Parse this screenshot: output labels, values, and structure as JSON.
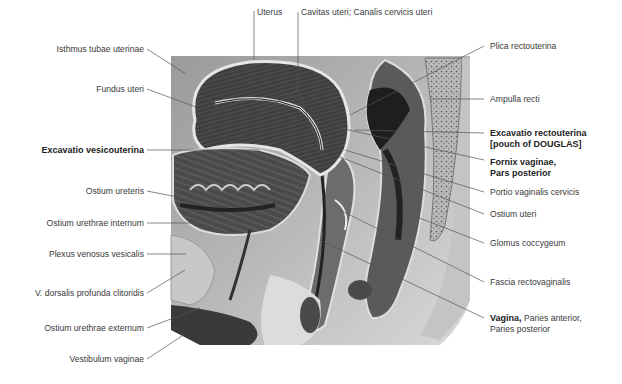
{
  "figure": {
    "colors": {
      "tissue_dark": "#3c3c3c",
      "tissue_mid": "#8a8a8a",
      "tissue_light": "#cfcfcf",
      "leader": "#444444",
      "background": "#ffffff"
    }
  },
  "labels_top": [
    {
      "id": "uterus",
      "text": "Uterus"
    },
    {
      "id": "cavitas",
      "text": "Cavitas uteri; Canalis cervicis uteri"
    }
  ],
  "labels_left": [
    {
      "id": "isthmus",
      "text": "Isthmus tubae uterinae",
      "bold": false
    },
    {
      "id": "fundus",
      "text": "Fundus uteri",
      "bold": false
    },
    {
      "id": "excavatio_vesico",
      "text": "Excavatio vesicouterina",
      "bold": true
    },
    {
      "id": "ostium_ureteris",
      "text": "Ostium ureteris",
      "bold": false
    },
    {
      "id": "ostium_urethrae_int",
      "text": "Ostium urethrae internum",
      "bold": false
    },
    {
      "id": "plexus",
      "text": "Plexus venosus vesicalis",
      "bold": false
    },
    {
      "id": "v_dorsalis",
      "text": "V. dorsalis profunda clitoridis",
      "bold": false
    },
    {
      "id": "ostium_urethrae_ext",
      "text": "Ostium urethrae externum",
      "bold": false
    },
    {
      "id": "vestibulum",
      "text": "Vestibulum vaginae",
      "bold": false
    }
  ],
  "labels_right": [
    {
      "id": "plica",
      "text": "Plica rectouterina",
      "bold": false
    },
    {
      "id": "ampulla",
      "text": "Ampulla recti",
      "bold": false
    },
    {
      "id": "excavatio_recto_1",
      "text": "Excavatio rectouterina",
      "bold": true
    },
    {
      "id": "excavatio_recto_2",
      "text": "[pouch of DOUGLAS]",
      "bold": true
    },
    {
      "id": "fornix_1",
      "text": "Fornix vaginae,",
      "bold": true
    },
    {
      "id": "fornix_2",
      "text": "Pars posterior",
      "bold": true
    },
    {
      "id": "portio",
      "text": "Portio vaginalis cervicis",
      "bold": false
    },
    {
      "id": "ostium_uteri",
      "text": "Ostium uteri",
      "bold": false
    },
    {
      "id": "glomus",
      "text": "Glomus coccygeum",
      "bold": false
    },
    {
      "id": "fascia",
      "text": "Fascia rectovaginalis",
      "bold": false
    },
    {
      "id": "vagina_bold",
      "text": "Vagina,",
      "bold": true
    },
    {
      "id": "vagina_rest",
      "text": " Paries anterior,",
      "bold": false
    },
    {
      "id": "vagina_2",
      "text": "Paries posterior",
      "bold": false
    }
  ]
}
